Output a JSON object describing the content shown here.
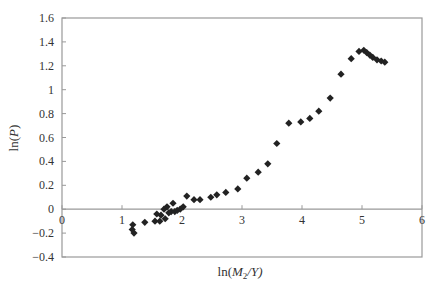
{
  "chart_data": {
    "type": "scatter",
    "title": "",
    "xlabel": "ln(M2/Y)",
    "xlabel_parts": {
      "prefix": "ln(",
      "var": "M",
      "sub": "2",
      "suffix": "/Y)"
    },
    "ylabel": "ln(P)",
    "ylabel_parts": {
      "prefix": "ln(",
      "var": "P",
      "suffix": ")"
    },
    "xlim": [
      0,
      6
    ],
    "ylim": [
      -0.4,
      1.6
    ],
    "xticks": [
      "0",
      "1",
      "2",
      "3",
      "4",
      "5",
      "6"
    ],
    "yticks": [
      "1.6",
      "1.4",
      "1.2",
      "1",
      "0.8",
      "0.6",
      "0.4",
      "0.2",
      "0",
      "-0.2",
      "-0.4"
    ],
    "grid": false,
    "legend": null,
    "marker": "diamond",
    "marker_color": "#222222",
    "axis_color": "#999999",
    "series": [
      {
        "name": "ln(P) vs ln(M2/Y)",
        "points": [
          [
            1.18,
            -0.13
          ],
          [
            1.17,
            -0.17
          ],
          [
            1.2,
            -0.2
          ],
          [
            1.38,
            -0.11
          ],
          [
            1.55,
            -0.1
          ],
          [
            1.63,
            -0.1
          ],
          [
            1.58,
            -0.04
          ],
          [
            1.65,
            -0.05
          ],
          [
            1.7,
            0.0
          ],
          [
            1.72,
            -0.08
          ],
          [
            1.75,
            0.02
          ],
          [
            1.78,
            -0.03
          ],
          [
            1.82,
            -0.02
          ],
          [
            1.85,
            0.05
          ],
          [
            1.88,
            -0.02
          ],
          [
            1.92,
            -0.01
          ],
          [
            1.97,
            0.0
          ],
          [
            2.02,
            0.02
          ],
          [
            2.08,
            0.11
          ],
          [
            2.2,
            0.08
          ],
          [
            2.3,
            0.08
          ],
          [
            2.48,
            0.1
          ],
          [
            2.58,
            0.12
          ],
          [
            2.73,
            0.14
          ],
          [
            2.93,
            0.17
          ],
          [
            3.08,
            0.26
          ],
          [
            3.27,
            0.31
          ],
          [
            3.43,
            0.38
          ],
          [
            3.58,
            0.55
          ],
          [
            3.78,
            0.72
          ],
          [
            3.98,
            0.73
          ],
          [
            4.13,
            0.76
          ],
          [
            4.28,
            0.82
          ],
          [
            4.47,
            0.93
          ],
          [
            4.65,
            1.13
          ],
          [
            4.82,
            1.26
          ],
          [
            4.95,
            1.32
          ],
          [
            5.03,
            1.33
          ],
          [
            5.08,
            1.31
          ],
          [
            5.13,
            1.29
          ],
          [
            5.18,
            1.27
          ],
          [
            5.25,
            1.25
          ],
          [
            5.32,
            1.24
          ],
          [
            5.38,
            1.23
          ]
        ]
      }
    ]
  }
}
